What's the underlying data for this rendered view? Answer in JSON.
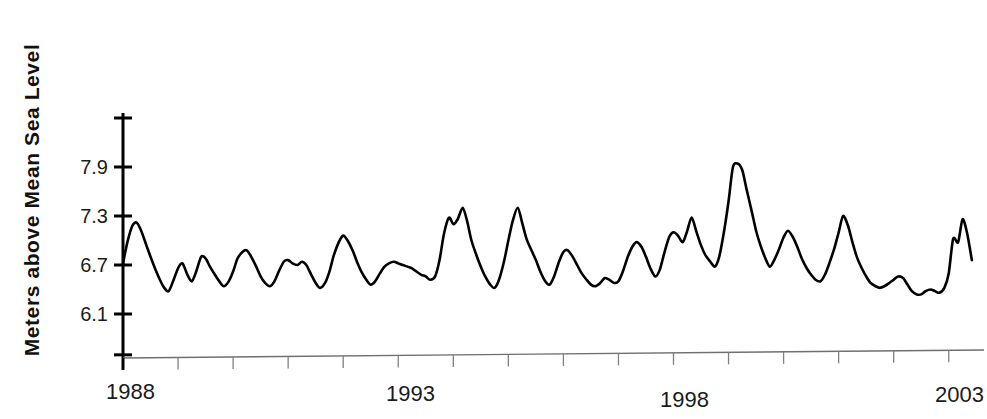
{
  "chart_data": {
    "type": "line",
    "title": "",
    "subtitle": "",
    "xlabel": "",
    "ylabel": "Meters above Mean Sea Level",
    "ylim": [
      5.6,
      8.4
    ],
    "xlim": [
      1988.0,
      2003.5
    ],
    "grid": false,
    "legend": null,
    "y_ticks": [
      8.5,
      7.9,
      7.3,
      6.7,
      6.1,
      5.6
    ],
    "y_tick_labels": [
      "",
      "7.9",
      "7.3",
      "6.7",
      "6.1",
      ""
    ],
    "x_ticks": [
      1988,
      1989,
      1990,
      1991,
      1992,
      1993,
      1994,
      1995,
      1996,
      1997,
      1998,
      1999,
      2000,
      2001,
      2002,
      2003
    ],
    "x_tick_labels": [
      "1988",
      "",
      "",
      "",
      "",
      "1993",
      "",
      "",
      "",
      "",
      "1998",
      "",
      "",
      "",
      "",
      "2003"
    ],
    "line_color": "#000000",
    "line_width": 2.6,
    "axis_color": "#000000",
    "series": [
      {
        "name": "Mean Sea Level",
        "x": [
          1988.0,
          1988.08,
          1988.17,
          1988.25,
          1988.33,
          1988.42,
          1988.5,
          1988.58,
          1988.67,
          1988.75,
          1988.83,
          1988.92,
          1989.0,
          1989.08,
          1989.17,
          1989.25,
          1989.33,
          1989.42,
          1989.5,
          1989.58,
          1989.67,
          1989.75,
          1989.83,
          1989.92,
          1990.0,
          1990.08,
          1990.17,
          1990.25,
          1990.33,
          1990.42,
          1990.5,
          1990.58,
          1990.67,
          1990.75,
          1990.83,
          1990.92,
          1991.0,
          1991.08,
          1991.17,
          1991.25,
          1991.33,
          1991.42,
          1991.5,
          1991.58,
          1991.67,
          1991.75,
          1991.83,
          1991.92,
          1992.0,
          1992.08,
          1992.17,
          1992.25,
          1992.33,
          1992.42,
          1992.5,
          1992.58,
          1992.67,
          1992.75,
          1992.83,
          1992.92,
          1993.0,
          1993.08,
          1993.17,
          1993.25,
          1993.33,
          1993.42,
          1993.5,
          1993.58,
          1993.67,
          1993.75,
          1993.83,
          1993.92,
          1994.0,
          1994.08,
          1994.17,
          1994.25,
          1994.33,
          1994.42,
          1994.5,
          1994.58,
          1994.67,
          1994.75,
          1994.83,
          1994.92,
          1995.0,
          1995.08,
          1995.17,
          1995.25,
          1995.33,
          1995.42,
          1995.5,
          1995.58,
          1995.67,
          1995.75,
          1995.83,
          1995.92,
          1996.0,
          1996.08,
          1996.17,
          1996.25,
          1996.33,
          1996.42,
          1996.5,
          1996.58,
          1996.67,
          1996.75,
          1996.83,
          1996.92,
          1997.0,
          1997.08,
          1997.17,
          1997.25,
          1997.33,
          1997.42,
          1997.5,
          1997.58,
          1997.67,
          1997.75,
          1997.83,
          1997.92,
          1998.0,
          1998.08,
          1998.17,
          1998.25,
          1998.33,
          1998.42,
          1998.5,
          1998.58,
          1998.67,
          1998.75,
          1998.83,
          1998.92,
          1999.0,
          1999.08,
          1999.17,
          1999.25,
          1999.33,
          1999.42,
          1999.5,
          1999.58,
          1999.67,
          1999.75,
          1999.83,
          1999.92,
          2000.0,
          2000.08,
          2000.17,
          2000.25,
          2000.33,
          2000.42,
          2000.5,
          2000.58,
          2000.67,
          2000.75,
          2000.83,
          2000.92,
          2001.0,
          2001.08,
          2001.17,
          2001.25,
          2001.33,
          2001.42,
          2001.5,
          2001.58,
          2001.67,
          2001.75,
          2001.83,
          2001.92,
          2002.0,
          2002.08,
          2002.17,
          2002.25,
          2002.33,
          2002.42,
          2002.5,
          2002.58,
          2002.67,
          2002.75,
          2002.83,
          2002.92,
          2003.0,
          2003.08,
          2003.17,
          2003.25,
          2003.33,
          2003.42
        ],
        "values": [
          6.72,
          6.98,
          7.18,
          7.22,
          7.12,
          6.95,
          6.8,
          6.66,
          6.52,
          6.42,
          6.38,
          6.52,
          6.66,
          6.72,
          6.58,
          6.5,
          6.62,
          6.8,
          6.78,
          6.68,
          6.58,
          6.5,
          6.44,
          6.5,
          6.62,
          6.78,
          6.86,
          6.88,
          6.8,
          6.68,
          6.56,
          6.48,
          6.44,
          6.5,
          6.62,
          6.74,
          6.76,
          6.72,
          6.7,
          6.74,
          6.7,
          6.58,
          6.48,
          6.42,
          6.48,
          6.62,
          6.82,
          6.98,
          7.06,
          7.0,
          6.88,
          6.74,
          6.62,
          6.52,
          6.46,
          6.5,
          6.6,
          6.68,
          6.72,
          6.74,
          6.72,
          6.7,
          6.68,
          6.66,
          6.62,
          6.58,
          6.56,
          6.52,
          6.56,
          6.76,
          7.08,
          7.28,
          7.2,
          7.26,
          7.4,
          7.24,
          7.0,
          6.82,
          6.68,
          6.56,
          6.46,
          6.42,
          6.52,
          6.74,
          7.0,
          7.24,
          7.4,
          7.22,
          7.02,
          6.88,
          6.76,
          6.62,
          6.5,
          6.46,
          6.56,
          6.74,
          6.86,
          6.88,
          6.8,
          6.7,
          6.6,
          6.52,
          6.46,
          6.44,
          6.48,
          6.54,
          6.52,
          6.48,
          6.5,
          6.62,
          6.8,
          6.92,
          6.98,
          6.92,
          6.8,
          6.66,
          6.56,
          6.64,
          6.84,
          7.04,
          7.1,
          7.06,
          6.98,
          7.12,
          7.28,
          7.1,
          6.94,
          6.82,
          6.74,
          6.68,
          6.8,
          7.12,
          7.48,
          7.9,
          7.94,
          7.86,
          7.62,
          7.36,
          7.12,
          6.94,
          6.78,
          6.68,
          6.76,
          6.9,
          7.04,
          7.12,
          7.04,
          6.92,
          6.78,
          6.66,
          6.58,
          6.52,
          6.5,
          6.58,
          6.72,
          6.9,
          7.1,
          7.3,
          7.18,
          6.98,
          6.8,
          6.66,
          6.56,
          6.48,
          6.44,
          6.42,
          6.44,
          6.48,
          6.52,
          6.56,
          6.54,
          6.46,
          6.38,
          6.34,
          6.34,
          6.38,
          6.4,
          6.38,
          6.36,
          6.42,
          6.6,
          7.02,
          6.98,
          7.26,
          7.1,
          6.76
        ]
      }
    ],
    "annotations": {
      "max_value": 7.94,
      "max_year": 1999,
      "min_value": 6.34,
      "min_year": 2002
    }
  },
  "axis": {
    "y_title": "Meters above Mean Sea Level",
    "y_tick_labels": [
      "7.9",
      "7.3",
      "6.7",
      "6.1"
    ],
    "x_tick_labels": [
      "1988",
      "1993",
      "1998",
      "2003"
    ]
  }
}
